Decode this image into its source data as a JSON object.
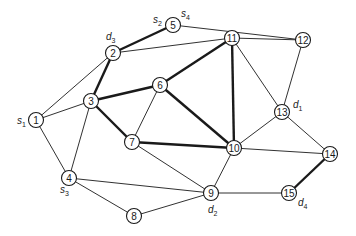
{
  "diagram": {
    "type": "network-graph",
    "nodes": [
      {
        "id": "1",
        "x": 36,
        "y": 120
      },
      {
        "id": "2",
        "x": 113,
        "y": 53
      },
      {
        "id": "3",
        "x": 91,
        "y": 101
      },
      {
        "id": "4",
        "x": 69,
        "y": 178
      },
      {
        "id": "5",
        "x": 173,
        "y": 25
      },
      {
        "id": "6",
        "x": 160,
        "y": 85
      },
      {
        "id": "7",
        "x": 132,
        "y": 142
      },
      {
        "id": "8",
        "x": 134,
        "y": 216
      },
      {
        "id": "9",
        "x": 211,
        "y": 193
      },
      {
        "id": "10",
        "x": 234,
        "y": 148
      },
      {
        "id": "11",
        "x": 232,
        "y": 38
      },
      {
        "id": "12",
        "x": 303,
        "y": 40
      },
      {
        "id": "13",
        "x": 282,
        "y": 112
      },
      {
        "id": "14",
        "x": 330,
        "y": 154
      },
      {
        "id": "15",
        "x": 289,
        "y": 193
      }
    ],
    "edges": [
      {
        "from": "2",
        "to": "5",
        "bold": true
      },
      {
        "from": "2",
        "to": "3",
        "bold": true
      },
      {
        "from": "3",
        "to": "6",
        "bold": true
      },
      {
        "from": "6",
        "to": "11",
        "bold": true
      },
      {
        "from": "3",
        "to": "7",
        "bold": true
      },
      {
        "from": "6",
        "to": "10",
        "bold": true
      },
      {
        "from": "7",
        "to": "10",
        "bold": true
      },
      {
        "from": "11",
        "to": "10",
        "bold": true
      },
      {
        "from": "14",
        "to": "15",
        "bold": true
      },
      {
        "from": "1",
        "to": "2",
        "bold": false
      },
      {
        "from": "1",
        "to": "3",
        "bold": false
      },
      {
        "from": "1",
        "to": "4",
        "bold": false
      },
      {
        "from": "3",
        "to": "4",
        "bold": false
      },
      {
        "from": "2",
        "to": "11",
        "bold": false
      },
      {
        "from": "5",
        "to": "12",
        "bold": false
      },
      {
        "from": "11",
        "to": "12",
        "bold": false
      },
      {
        "from": "12",
        "to": "13",
        "bold": false
      },
      {
        "from": "11",
        "to": "13",
        "bold": false
      },
      {
        "from": "13",
        "to": "10",
        "bold": false
      },
      {
        "from": "13",
        "to": "14",
        "bold": false
      },
      {
        "from": "10",
        "to": "14",
        "bold": false
      },
      {
        "from": "6",
        "to": "7",
        "bold": false
      },
      {
        "from": "7",
        "to": "9",
        "bold": false
      },
      {
        "from": "4",
        "to": "9",
        "bold": false
      },
      {
        "from": "4",
        "to": "8",
        "bold": false
      },
      {
        "from": "8",
        "to": "9",
        "bold": false
      },
      {
        "from": "9",
        "to": "10",
        "bold": false
      },
      {
        "from": "9",
        "to": "15",
        "bold": false
      }
    ],
    "labels": [
      {
        "node": "1",
        "base": "s",
        "sub": "1",
        "x": 17,
        "y": 124
      },
      {
        "node": "5",
        "base": "s",
        "sub": "2",
        "x": 153,
        "y": 23
      },
      {
        "node": "5",
        "base": "s",
        "sub": "4",
        "x": 181,
        "y": 17
      },
      {
        "node": "4",
        "base": "s",
        "sub": "3",
        "x": 60,
        "y": 193
      },
      {
        "node": "2",
        "base": "d",
        "sub": "3",
        "x": 106,
        "y": 40
      },
      {
        "node": "13",
        "base": "d",
        "sub": "1",
        "x": 293,
        "y": 108
      },
      {
        "node": "9",
        "base": "d",
        "sub": "2",
        "x": 208,
        "y": 213
      },
      {
        "node": "15",
        "base": "d",
        "sub": "4",
        "x": 298,
        "y": 206
      }
    ]
  }
}
